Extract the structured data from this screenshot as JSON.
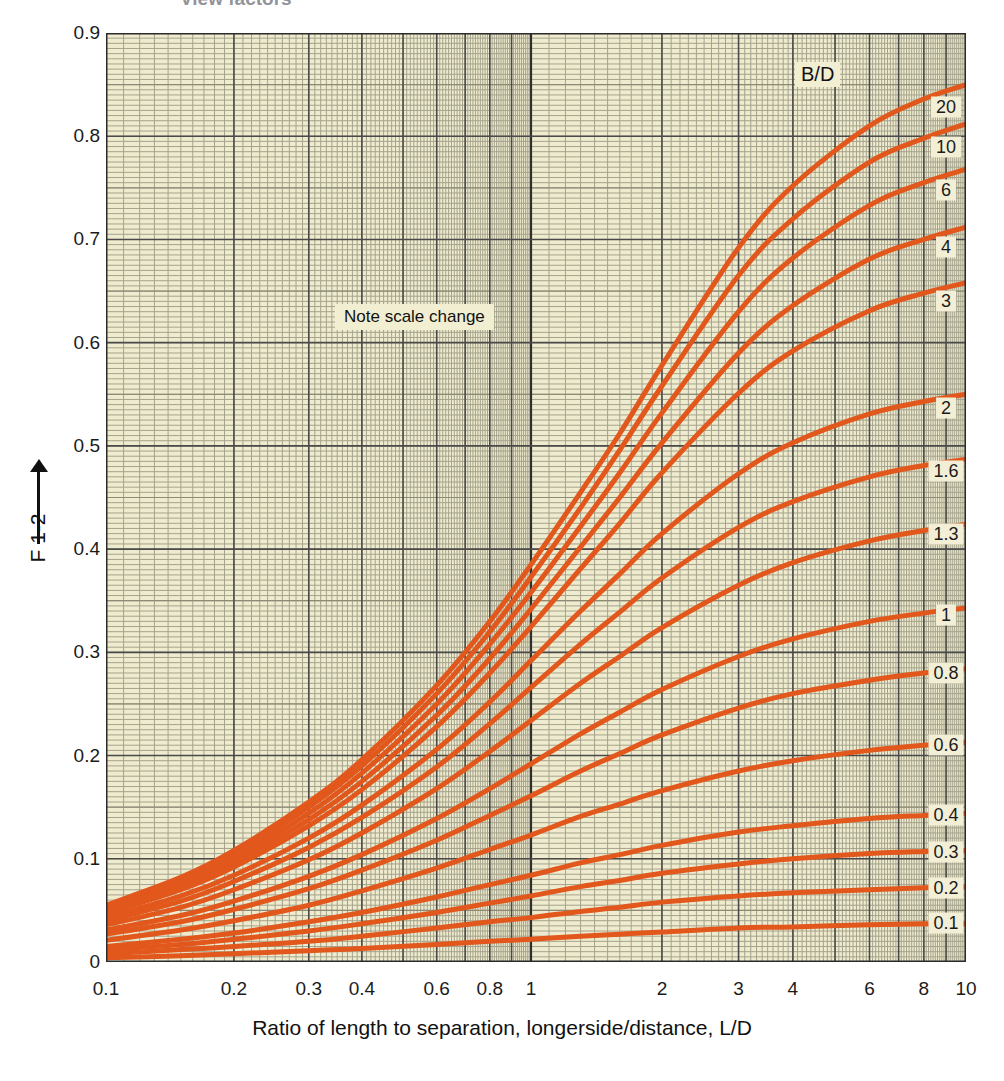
{
  "cut_title": "View factors",
  "axes": {
    "y": {
      "label": "F",
      "label_sub": "1-2",
      "label_full": "F 1-2",
      "ticks": [
        "0.9",
        "0.8",
        "0.7",
        "0.6",
        "0.5",
        "0.4",
        "0.3",
        "0.2",
        "0.1",
        "0"
      ],
      "tick_values": [
        0.9,
        0.8,
        0.7,
        0.6,
        0.5,
        0.4,
        0.3,
        0.2,
        0.1,
        0
      ],
      "range": [
        0,
        0.9
      ],
      "arrow": "up-arrow"
    },
    "x": {
      "label": "Ratio of length to separation, longerside/distance, L/D",
      "ticks": [
        "0.1",
        "0.2",
        "0.3",
        "0.4",
        "0.6",
        "0.8",
        "1",
        "2",
        "3",
        "4",
        "6",
        "8",
        "10"
      ],
      "tick_values": [
        0.1,
        0.2,
        0.3,
        0.4,
        0.6,
        0.8,
        1,
        2,
        3,
        4,
        6,
        8,
        10
      ],
      "range": [
        0.1,
        10
      ],
      "scale": "log (piecewise, scale change at 1)"
    }
  },
  "annotations": {
    "note_scale_change": "Note scale change",
    "family_header": "B/D"
  },
  "style": {
    "curve_color": "#e2571c",
    "plot_bg": "#efebcf",
    "grid_minor": "#9b9a84",
    "grid_major": "#4c4c4c",
    "label_bg": "#f3efd6",
    "text_color": "#1b1b1b"
  },
  "chart_data": {
    "type": "line",
    "title": "View factors",
    "xlabel": "Ratio of length to separation, longerside/distance, L/D",
    "ylabel": "F 1-2",
    "xscale": "log",
    "xlim": [
      0.1,
      10
    ],
    "ylim": [
      0,
      0.9
    ],
    "grid": true,
    "legend": "inline curve labels at right, family parameter B/D",
    "scale_change_at_x": 1,
    "x": [
      0.1,
      0.15,
      0.2,
      0.3,
      0.4,
      0.6,
      0.8,
      1.0,
      1.3,
      1.6,
      2.0,
      3.0,
      4.0,
      6.0,
      8.0,
      10.0
    ],
    "series": [
      {
        "name": "20",
        "values": [
          0.055,
          0.082,
          0.108,
          0.155,
          0.196,
          0.268,
          0.33,
          0.385,
          0.455,
          0.512,
          0.578,
          0.692,
          0.752,
          0.81,
          0.836,
          0.85
        ]
      },
      {
        "name": "10",
        "values": [
          0.053,
          0.079,
          0.104,
          0.15,
          0.19,
          0.26,
          0.32,
          0.373,
          0.44,
          0.496,
          0.558,
          0.665,
          0.72,
          0.775,
          0.798,
          0.812
        ]
      },
      {
        "name": "6",
        "values": [
          0.051,
          0.076,
          0.1,
          0.144,
          0.183,
          0.25,
          0.308,
          0.358,
          0.422,
          0.474,
          0.532,
          0.63,
          0.682,
          0.733,
          0.755,
          0.768
        ]
      },
      {
        "name": "4",
        "values": [
          0.049,
          0.073,
          0.096,
          0.138,
          0.175,
          0.239,
          0.294,
          0.342,
          0.402,
          0.45,
          0.503,
          0.59,
          0.636,
          0.681,
          0.7,
          0.712
        ]
      },
      {
        "name": "3",
        "values": [
          0.047,
          0.07,
          0.092,
          0.132,
          0.167,
          0.228,
          0.28,
          0.325,
          0.381,
          0.425,
          0.474,
          0.551,
          0.592,
          0.631,
          0.648,
          0.658
        ]
      },
      {
        "name": "2",
        "values": [
          0.043,
          0.064,
          0.084,
          0.12,
          0.152,
          0.206,
          0.252,
          0.292,
          0.34,
          0.376,
          0.415,
          0.473,
          0.503,
          0.531,
          0.543,
          0.55
        ]
      },
      {
        "name": "1.6",
        "values": [
          0.04,
          0.059,
          0.078,
          0.111,
          0.14,
          0.189,
          0.231,
          0.266,
          0.308,
          0.339,
          0.372,
          0.421,
          0.446,
          0.47,
          0.481,
          0.487
        ]
      },
      {
        "name": "1.3",
        "values": [
          0.036,
          0.053,
          0.07,
          0.099,
          0.125,
          0.168,
          0.204,
          0.234,
          0.27,
          0.296,
          0.324,
          0.365,
          0.387,
          0.408,
          0.418,
          0.424
        ]
      },
      {
        "name": "1",
        "values": [
          0.031,
          0.045,
          0.059,
          0.083,
          0.104,
          0.139,
          0.168,
          0.192,
          0.221,
          0.242,
          0.264,
          0.296,
          0.313,
          0.33,
          0.338,
          0.343
        ]
      },
      {
        "name": "0.8",
        "values": [
          0.027,
          0.039,
          0.051,
          0.071,
          0.089,
          0.118,
          0.142,
          0.161,
          0.185,
          0.202,
          0.22,
          0.246,
          0.26,
          0.273,
          0.28,
          0.284
        ]
      },
      {
        "name": "0.6",
        "values": [
          0.021,
          0.031,
          0.04,
          0.055,
          0.069,
          0.091,
          0.109,
          0.123,
          0.141,
          0.153,
          0.166,
          0.185,
          0.195,
          0.205,
          0.21,
          0.213
        ]
      },
      {
        "name": "0.4",
        "values": [
          0.015,
          0.022,
          0.028,
          0.039,
          0.048,
          0.063,
          0.075,
          0.084,
          0.096,
          0.104,
          0.113,
          0.126,
          0.132,
          0.139,
          0.142,
          0.144
        ]
      },
      {
        "name": "0.3",
        "values": [
          0.012,
          0.017,
          0.022,
          0.03,
          0.037,
          0.048,
          0.057,
          0.064,
          0.073,
          0.079,
          0.086,
          0.095,
          0.1,
          0.105,
          0.107,
          0.108
        ]
      },
      {
        "name": "0.2",
        "values": [
          0.008,
          0.012,
          0.015,
          0.02,
          0.025,
          0.033,
          0.039,
          0.043,
          0.049,
          0.053,
          0.058,
          0.064,
          0.067,
          0.07,
          0.072,
          0.073
        ]
      },
      {
        "name": "0.1",
        "values": [
          0.004,
          0.006,
          0.008,
          0.011,
          0.013,
          0.017,
          0.02,
          0.022,
          0.025,
          0.027,
          0.029,
          0.033,
          0.034,
          0.036,
          0.037,
          0.037
        ]
      }
    ],
    "curve_labels": [
      {
        "name": "20",
        "x": 9.0,
        "y": 0.828
      },
      {
        "name": "10",
        "x": 9.0,
        "y": 0.79
      },
      {
        "name": "6",
        "x": 9.0,
        "y": 0.748
      },
      {
        "name": "4",
        "x": 9.0,
        "y": 0.693
      },
      {
        "name": "3",
        "x": 9.0,
        "y": 0.64
      },
      {
        "name": "2",
        "x": 9.0,
        "y": 0.537
      },
      {
        "name": "1.6",
        "x": 9.0,
        "y": 0.476
      },
      {
        "name": "1.3",
        "x": 9.0,
        "y": 0.415
      },
      {
        "name": "1",
        "x": 9.0,
        "y": 0.336
      },
      {
        "name": "0.8",
        "x": 9.0,
        "y": 0.28
      },
      {
        "name": "0.6",
        "x": 9.0,
        "y": 0.21
      },
      {
        "name": "0.4",
        "x": 9.0,
        "y": 0.142
      },
      {
        "name": "0.3",
        "x": 9.0,
        "y": 0.107
      },
      {
        "name": "0.2",
        "x": 9.0,
        "y": 0.072
      },
      {
        "name": "0.1",
        "x": 9.0,
        "y": 0.038
      }
    ]
  }
}
